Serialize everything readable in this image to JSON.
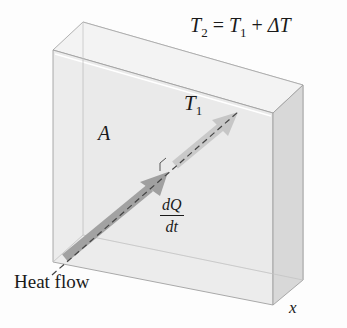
{
  "diagram": {
    "title_equation": {
      "lhs_symbol": "T",
      "lhs_sub": "2",
      "equals": " = ",
      "rhs_symbol": "T",
      "rhs_sub": "1",
      "plus": " + ",
      "delta": "ΔT"
    },
    "labels": {
      "t1_symbol": "T",
      "t1_sub": "1",
      "area": "A",
      "rate_numerator": "dQ",
      "rate_denominator": "dt",
      "heat_flow": "Heat flow",
      "axis_x": "x"
    },
    "colors": {
      "slab_front": "#ececec",
      "slab_side": "#dcdcdc",
      "slab_top": "#f2f2f2",
      "arrow_dark": "#9a9a9a",
      "arrow_light": "#c8c8c8",
      "edge": "#9c9c9c"
    }
  }
}
